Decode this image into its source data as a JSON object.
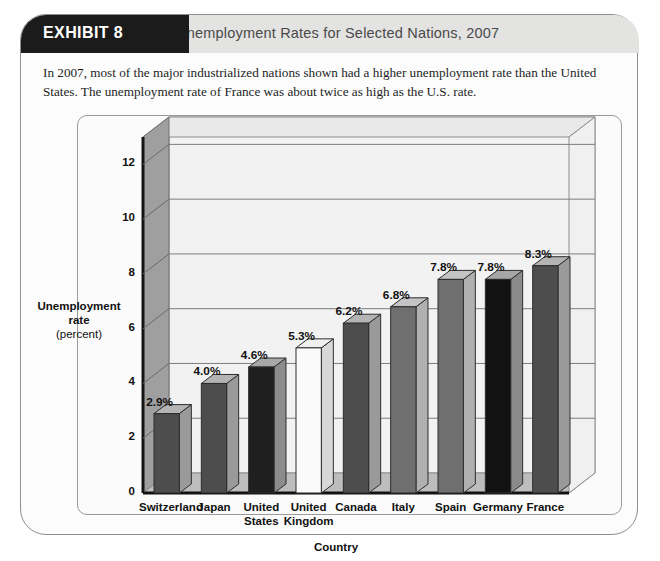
{
  "exhibit": {
    "tab_label": "EXHIBIT 8",
    "title": "Unemployment Rates for Selected Nations, 2007",
    "description": "In 2007, most of the major industrialized nations shown had a higher unemployment rate than the United States. The unemployment rate of France was about twice as high as the U.S. rate."
  },
  "axis": {
    "y_label_line1": "Unemployment",
    "y_label_line2": "rate",
    "y_label_line3": "(percent)",
    "x_title": "Country"
  },
  "chart_data": {
    "type": "bar",
    "title": "Unemployment Rates for Selected Nations, 2007",
    "xlabel": "Country",
    "ylabel": "Unemployment rate (percent)",
    "ylim": [
      0,
      13
    ],
    "yticks": [
      0,
      2,
      4,
      6,
      8,
      10,
      12
    ],
    "ytick_labels": [
      "0",
      "2",
      "4",
      "6",
      "8",
      "10",
      "12"
    ],
    "grid": true,
    "legend": "none",
    "categories": [
      "Switzerland",
      "Japan",
      "United States",
      "United Kingdom",
      "Canada",
      "Italy",
      "Spain",
      "Germany",
      "France"
    ],
    "category_lines": [
      [
        "Switzerland"
      ],
      [
        "Japan"
      ],
      [
        "United",
        "States"
      ],
      [
        "United",
        "Kingdom"
      ],
      [
        "Canada"
      ],
      [
        "Italy"
      ],
      [
        "Spain"
      ],
      [
        "Germany"
      ],
      [
        "France"
      ]
    ],
    "values": [
      2.9,
      4.0,
      4.6,
      5.3,
      6.2,
      6.8,
      7.8,
      7.8,
      8.3
    ],
    "data_labels": [
      "2.9%",
      "4.0%",
      "4.6%",
      "5.3%",
      "6.2%",
      "6.8%",
      "7.8%",
      "7.8%",
      "8.3%"
    ],
    "bar_colors": [
      "#4d4d4d",
      "#4d4d4d",
      "#1f1f1f",
      "#fafafa",
      "#4d4d4d",
      "#6f6f6f",
      "#6f6f6f",
      "#121212",
      "#4d4d4d"
    ],
    "bar_side_colors": [
      "#9a9a9a",
      "#9a9a9a",
      "#8c8c8c",
      "#d8d8d8",
      "#9a9a9a",
      "#b0b0b0",
      "#b0b0b0",
      "#8a8a8a",
      "#9a9a9a"
    ],
    "bar_top_colors": [
      "#b4b4b4",
      "#b4b4b4",
      "#a8a8a8",
      "#efefef",
      "#b4b4b4",
      "#c4c4c4",
      "#c4c4c4",
      "#a6a6a6",
      "#b4b4b4"
    ]
  },
  "colors": {
    "tab_background": "#1b1b1b",
    "band_background": "#e3e3e1",
    "title_text": "#4a4a4a",
    "frame_border": "#8f8f8f",
    "wall_back": "#f2f2f2",
    "wall_left": "#9f9f9f",
    "floor": "#bdbdbd",
    "gridline": "#7d7d7d"
  }
}
